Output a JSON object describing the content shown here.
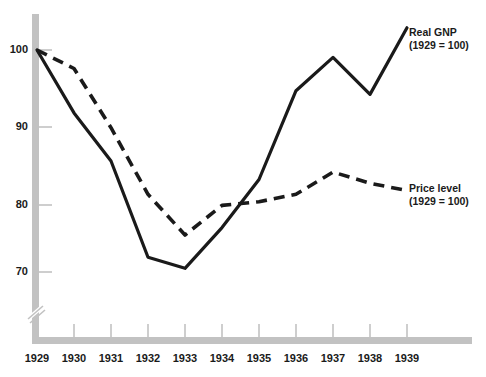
{
  "chart_data": {
    "type": "line",
    "title": "",
    "xlabel": "",
    "ylabel": "",
    "categories": [
      "1929",
      "1930",
      "1931",
      "1932",
      "1933",
      "1934",
      "1935",
      "1936",
      "1937",
      "1938",
      "1939"
    ],
    "ylim": [
      68,
      105
    ],
    "yticks": [
      70,
      80,
      90,
      100
    ],
    "grid": false,
    "axis_break": true,
    "legend_position": "right-inline",
    "series": [
      {
        "name": "Real GNP",
        "note": "(1929 = 100)",
        "style": "solid",
        "values": [
          100,
          91.5,
          85,
          72,
          70.5,
          76,
          82.5,
          94.5,
          99,
          94,
          103
        ]
      },
      {
        "name": "Price level",
        "note": "(1929 = 100)",
        "style": "dashed",
        "values": [
          100,
          97.5,
          89.5,
          80.5,
          75,
          79,
          79.5,
          80.5,
          83.5,
          82,
          81
        ]
      }
    ]
  },
  "axes": {
    "y_tick_labels": [
      "100",
      "90",
      "80",
      "70"
    ],
    "x_tick_labels": [
      "1929",
      "1930",
      "1931",
      "1932",
      "1933",
      "1934",
      "1935",
      "1936",
      "1937",
      "1938",
      "1939"
    ]
  },
  "annotations": {
    "real_gnp": {
      "line1": "Real GNP",
      "line2": "(1929 = 100)"
    },
    "price_level": {
      "line1": "Price level",
      "line2": "(1929 = 100)"
    }
  },
  "colors": {
    "line": "#1a1a1a",
    "axis": "#c2c2c2",
    "text": "#1a1a1a",
    "background": "#ffffff"
  }
}
